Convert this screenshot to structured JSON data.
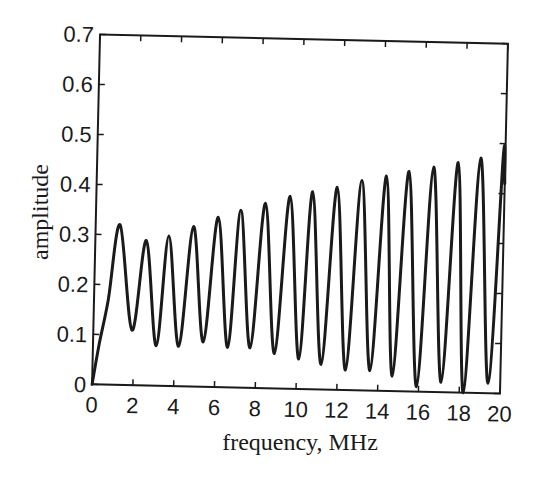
{
  "chart_data": {
    "type": "line",
    "title": "",
    "xlabel": "frequency, MHz",
    "ylabel": "amplitude",
    "xlim": [
      0,
      20
    ],
    "ylim": [
      0,
      0.7
    ],
    "xticks": [
      0,
      2,
      4,
      6,
      8,
      10,
      12,
      14,
      16,
      18,
      20
    ],
    "xtick_labels": [
      "0",
      "2",
      "4",
      "6",
      "8",
      "10",
      "12",
      "14",
      "16",
      "18",
      "20"
    ],
    "yticks": [
      0,
      0.1,
      0.2,
      0.3,
      0.4,
      0.5,
      0.6,
      0.7
    ],
    "ytick_labels": [
      "0",
      "0.1",
      "0.2",
      "0.3",
      "0.4",
      "0.5",
      "0.6",
      "0.7"
    ],
    "grid": false,
    "legend": null,
    "series": [
      {
        "name": "amplitude",
        "color": "#1a1a1a",
        "x": [
          0,
          0.3,
          0.7,
          1.2,
          1.9,
          2.5,
          3.1,
          3.6,
          4.2,
          4.8,
          5.4,
          6.0,
          6.6,
          7.1,
          7.7,
          8.3,
          8.9,
          9.5,
          10.1,
          10.6,
          11.2,
          11.8,
          12.4,
          13.0,
          13.6,
          14.2,
          14.7,
          15.3,
          15.9,
          16.5,
          17.1,
          17.7,
          18.2,
          18.8,
          19.4,
          19.9,
          20.0
        ],
        "y": [
          0,
          0.08,
          0.17,
          0.32,
          0.11,
          0.29,
          0.08,
          0.3,
          0.08,
          0.32,
          0.09,
          0.34,
          0.08,
          0.355,
          0.08,
          0.37,
          0.07,
          0.385,
          0.06,
          0.395,
          0.05,
          0.405,
          0.04,
          0.42,
          0.04,
          0.43,
          0.03,
          0.44,
          0.01,
          0.45,
          0.02,
          0.46,
          0.0,
          0.47,
          0.02,
          0.475,
          0.42
        ]
      }
    ]
  }
}
